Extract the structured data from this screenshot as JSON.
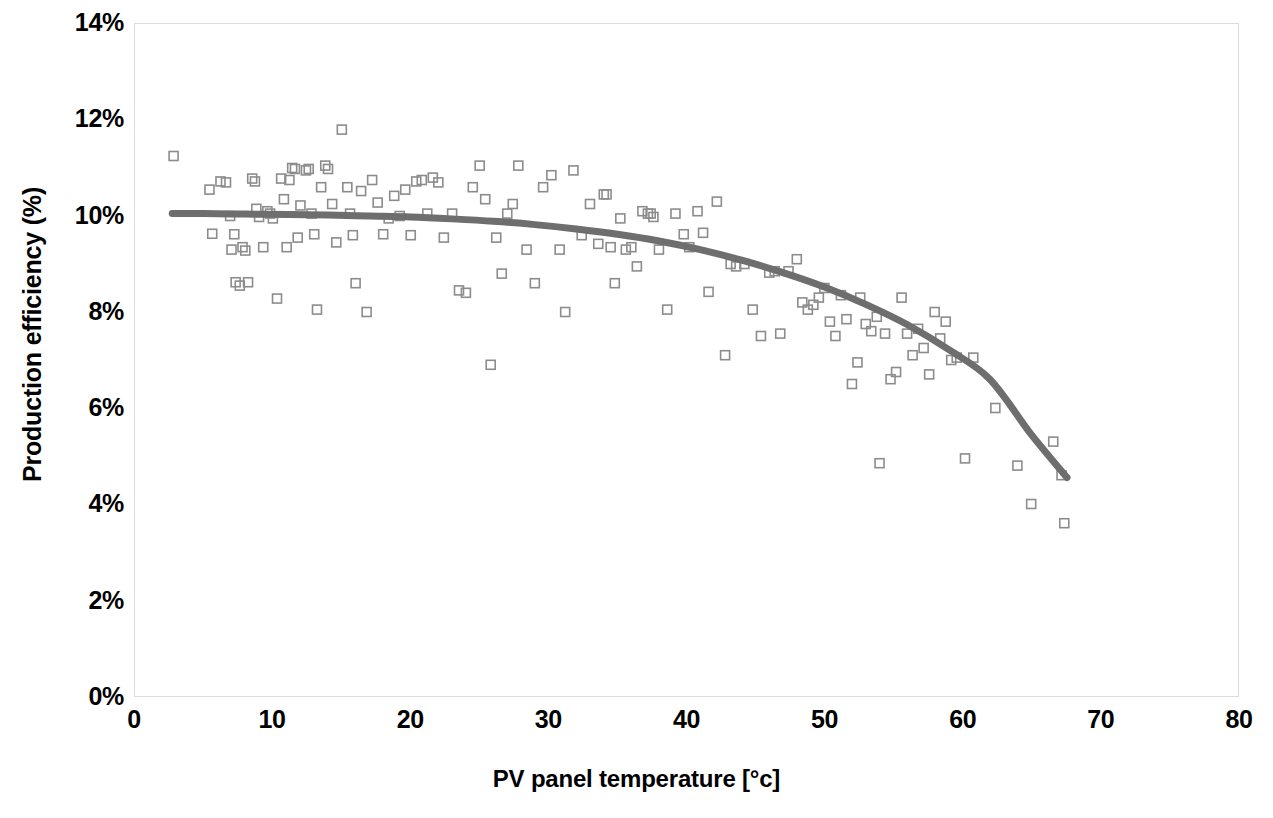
{
  "chart_data": {
    "type": "scatter",
    "title": "",
    "xlabel": "PV panel temperature [°c]",
    "ylabel": "Production efficiency (%)",
    "xlim": [
      0,
      80
    ],
    "ylim": [
      0,
      14
    ],
    "xticks": [
      0,
      10,
      20,
      30,
      40,
      50,
      60,
      70,
      80
    ],
    "yticks": [
      0,
      2,
      4,
      6,
      8,
      10,
      12,
      14
    ],
    "xtick_labels": [
      "0",
      "10",
      "20",
      "30",
      "40",
      "50",
      "60",
      "70",
      "80"
    ],
    "ytick_labels": [
      "0%",
      "2%",
      "4%",
      "6%",
      "8%",
      "10%",
      "12%",
      "14%"
    ],
    "grid": false,
    "legend": "none",
    "marker": {
      "shape": "open-square",
      "size_px": 9,
      "stroke": "#8c8c8c",
      "stroke_width": 1.6,
      "fill": "none"
    },
    "trendline": {
      "name": "polynomial trend",
      "color": "#6e6e6e",
      "width_px": 7,
      "x": [
        2.7,
        5,
        8,
        11,
        14,
        17,
        20,
        23,
        26,
        29,
        32,
        35,
        38,
        41,
        44,
        47,
        50,
        53,
        56,
        59,
        62,
        65,
        67.6
      ],
      "y": [
        10.05,
        10.05,
        10.04,
        10.03,
        10.02,
        10.0,
        9.98,
        9.94,
        9.89,
        9.82,
        9.73,
        9.62,
        9.48,
        9.3,
        9.08,
        8.82,
        8.52,
        8.16,
        7.74,
        7.22,
        6.6,
        5.45,
        4.55
      ]
    },
    "series": [
      {
        "name": "Measured efficiency",
        "points": [
          [
            2.8,
            11.25
          ],
          [
            5.4,
            10.55
          ],
          [
            5.6,
            9.63
          ],
          [
            6.2,
            10.72
          ],
          [
            6.6,
            10.7
          ],
          [
            6.9,
            10.0
          ],
          [
            7.0,
            9.3
          ],
          [
            7.2,
            9.62
          ],
          [
            7.3,
            8.62
          ],
          [
            7.6,
            8.55
          ],
          [
            7.8,
            9.35
          ],
          [
            8.0,
            9.28
          ],
          [
            8.2,
            8.62
          ],
          [
            8.5,
            10.78
          ],
          [
            8.7,
            10.72
          ],
          [
            8.8,
            10.15
          ],
          [
            9.0,
            9.98
          ],
          [
            9.3,
            9.35
          ],
          [
            9.6,
            10.1
          ],
          [
            9.8,
            10.05
          ],
          [
            10.0,
            9.95
          ],
          [
            10.3,
            8.28
          ],
          [
            10.6,
            10.78
          ],
          [
            10.8,
            10.35
          ],
          [
            11.0,
            9.35
          ],
          [
            11.2,
            10.75
          ],
          [
            11.4,
            11.0
          ],
          [
            11.6,
            10.98
          ],
          [
            11.8,
            9.55
          ],
          [
            12.0,
            10.22
          ],
          [
            12.4,
            10.95
          ],
          [
            12.6,
            10.98
          ],
          [
            12.8,
            10.05
          ],
          [
            13.0,
            9.62
          ],
          [
            13.2,
            8.05
          ],
          [
            13.5,
            10.6
          ],
          [
            13.8,
            11.05
          ],
          [
            14.0,
            10.98
          ],
          [
            14.3,
            10.25
          ],
          [
            14.6,
            9.45
          ],
          [
            15.0,
            11.8
          ],
          [
            15.4,
            10.6
          ],
          [
            15.6,
            10.05
          ],
          [
            15.8,
            9.6
          ],
          [
            16.0,
            8.6
          ],
          [
            16.4,
            10.52
          ],
          [
            16.8,
            8.0
          ],
          [
            17.2,
            10.75
          ],
          [
            17.6,
            10.28
          ],
          [
            18.0,
            9.62
          ],
          [
            18.4,
            9.95
          ],
          [
            18.8,
            10.42
          ],
          [
            19.2,
            10.0
          ],
          [
            19.6,
            10.55
          ],
          [
            20.0,
            9.6
          ],
          [
            20.4,
            10.72
          ],
          [
            20.8,
            10.75
          ],
          [
            21.2,
            10.05
          ],
          [
            21.6,
            10.8
          ],
          [
            22.0,
            10.7
          ],
          [
            22.4,
            9.55
          ],
          [
            23.0,
            10.05
          ],
          [
            23.5,
            8.45
          ],
          [
            24.0,
            8.4
          ],
          [
            24.5,
            10.6
          ],
          [
            25.0,
            11.05
          ],
          [
            25.4,
            10.35
          ],
          [
            25.8,
            6.9
          ],
          [
            26.2,
            9.55
          ],
          [
            26.6,
            8.8
          ],
          [
            27.0,
            10.05
          ],
          [
            27.4,
            10.25
          ],
          [
            27.8,
            11.05
          ],
          [
            28.4,
            9.3
          ],
          [
            29.0,
            8.6
          ],
          [
            29.6,
            10.6
          ],
          [
            30.2,
            10.85
          ],
          [
            30.8,
            9.3
          ],
          [
            31.2,
            8.0
          ],
          [
            31.8,
            10.95
          ],
          [
            32.4,
            9.6
          ],
          [
            33.0,
            10.25
          ],
          [
            33.6,
            9.42
          ],
          [
            34.0,
            10.45
          ],
          [
            34.2,
            10.45
          ],
          [
            34.5,
            9.35
          ],
          [
            34.8,
            8.6
          ],
          [
            35.2,
            9.95
          ],
          [
            35.6,
            9.3
          ],
          [
            36.0,
            9.35
          ],
          [
            36.4,
            8.95
          ],
          [
            36.8,
            10.1
          ],
          [
            37.2,
            10.05
          ],
          [
            37.4,
            10.05
          ],
          [
            37.6,
            9.98
          ],
          [
            38.0,
            9.3
          ],
          [
            38.6,
            8.05
          ],
          [
            39.2,
            10.05
          ],
          [
            39.8,
            9.62
          ],
          [
            40.2,
            9.35
          ],
          [
            40.8,
            10.1
          ],
          [
            41.2,
            9.65
          ],
          [
            41.6,
            8.42
          ],
          [
            42.2,
            10.3
          ],
          [
            42.8,
            7.1
          ],
          [
            43.2,
            9.0
          ],
          [
            43.6,
            8.95
          ],
          [
            44.2,
            9.0
          ],
          [
            44.8,
            8.05
          ],
          [
            45.4,
            7.5
          ],
          [
            46.0,
            8.82
          ],
          [
            46.4,
            8.85
          ],
          [
            46.8,
            7.55
          ],
          [
            47.4,
            8.85
          ],
          [
            48.0,
            9.1
          ],
          [
            48.4,
            8.2
          ],
          [
            48.8,
            8.05
          ],
          [
            49.2,
            8.15
          ],
          [
            49.6,
            8.3
          ],
          [
            50.0,
            8.5
          ],
          [
            50.4,
            7.8
          ],
          [
            50.8,
            7.5
          ],
          [
            51.2,
            8.35
          ],
          [
            51.6,
            7.85
          ],
          [
            52.0,
            6.5
          ],
          [
            52.4,
            6.95
          ],
          [
            52.6,
            8.3
          ],
          [
            53.0,
            7.75
          ],
          [
            53.4,
            7.6
          ],
          [
            53.8,
            7.9
          ],
          [
            54.0,
            4.85
          ],
          [
            54.4,
            7.55
          ],
          [
            54.8,
            6.6
          ],
          [
            55.2,
            6.75
          ],
          [
            55.6,
            8.3
          ],
          [
            56.0,
            7.55
          ],
          [
            56.4,
            7.1
          ],
          [
            56.8,
            7.65
          ],
          [
            57.2,
            7.25
          ],
          [
            57.6,
            6.7
          ],
          [
            58.0,
            8.0
          ],
          [
            58.4,
            7.45
          ],
          [
            58.8,
            7.8
          ],
          [
            59.2,
            7.0
          ],
          [
            59.6,
            7.05
          ],
          [
            60.2,
            4.95
          ],
          [
            60.8,
            7.05
          ],
          [
            62.4,
            6.0
          ],
          [
            64.0,
            4.8
          ],
          [
            65.0,
            4.0
          ],
          [
            66.6,
            5.3
          ],
          [
            67.2,
            4.6
          ],
          [
            67.4,
            3.6
          ]
        ]
      }
    ]
  }
}
